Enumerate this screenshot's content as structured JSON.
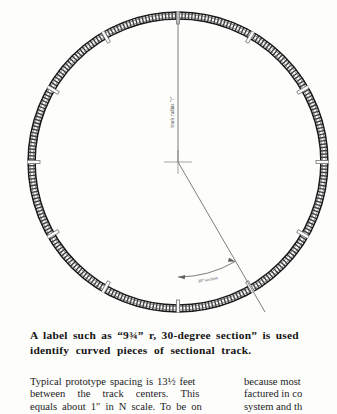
{
  "figure": {
    "name": "sectional-track-circle-diagram",
    "radius_label": "track radius \"r\"",
    "angle_label": "30° section",
    "joint_count": 12,
    "section_angle_degrees": 30,
    "circle": {
      "center_x": 178,
      "center_y": 162,
      "radius": 150
    },
    "colors": {
      "track": "#2b2b2b",
      "rail": "#1a1a1a",
      "joint": "#9a9a9a",
      "dimension_line": "#6f6f6f",
      "label_text": "#4a4a4a",
      "page_background": "#fdfdfc"
    }
  },
  "caption": {
    "line1": "A label such as “9¾” r, 30-degree section” is used",
    "line2": "identify curved pieces of sectional track."
  },
  "body": {
    "left_column": {
      "line1": "Typical prototype spacing is 13½ feet",
      "line2": "between the track centers. This",
      "line3": "equals about 1″ in N scale. To be on"
    },
    "right_column": {
      "line1": "because most",
      "line2": "factured in co",
      "line3": "system and th"
    }
  }
}
